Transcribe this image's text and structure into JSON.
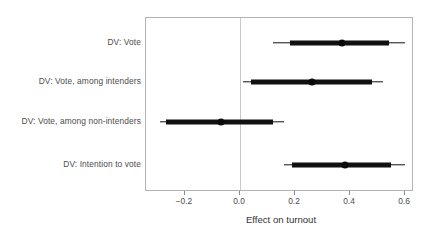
{
  "chart_data": {
    "type": "scatter",
    "subtype": "coefficient-dot-and-whisker-plot",
    "title": "",
    "xlabel": "Effect on turnout",
    "ylabel": "",
    "xlim": [
      -0.315,
      0.632
    ],
    "xticks": [
      -0.2,
      0.0,
      0.2,
      0.4,
      0.6
    ],
    "xticklabels": [
      "−0.2",
      "0.0",
      "0.2",
      "0.4",
      "0.6"
    ],
    "grid": false,
    "legend": null,
    "reference_line": {
      "x": 0.0,
      "style": "solid-light-gray",
      "color": "#bfbfbf"
    },
    "categories": [
      "DV: Vote",
      "DV: Vote, among intenders",
      "DV: Vote, among non-intenders",
      "DV: Intention to vote"
    ],
    "series": [
      {
        "name": "Effect on turnout",
        "color": "#111111",
        "points": [
          {
            "category": "DV: Vote",
            "estimate": 0.37,
            "inner_low": 0.18,
            "inner_high": 0.54,
            "outer_low": 0.12,
            "outer_high": 0.6
          },
          {
            "category": "DV: Vote, among intenders",
            "estimate": 0.26,
            "inner_low": 0.04,
            "inner_high": 0.48,
            "outer_low": 0.01,
            "outer_high": 0.52
          },
          {
            "category": "DV: Vote, among non-intenders",
            "estimate": -0.07,
            "inner_low": -0.27,
            "inner_high": 0.12,
            "outer_low": -0.29,
            "outer_high": 0.16
          },
          {
            "category": "DV: Intention to vote",
            "estimate": 0.38,
            "inner_low": 0.19,
            "inner_high": 0.55,
            "outer_low": 0.16,
            "outer_high": 0.6
          }
        ]
      }
    ]
  },
  "axis": {
    "x_title": "Effect on turnout"
  },
  "ylabels": [
    "DV: Vote",
    "DV: Vote, among intenders",
    "DV: Vote, among non-intenders",
    "DV: Intention to vote"
  ],
  "xticklabels": [
    "−0.2",
    "0.0",
    "0.2",
    "0.4",
    "0.6"
  ]
}
